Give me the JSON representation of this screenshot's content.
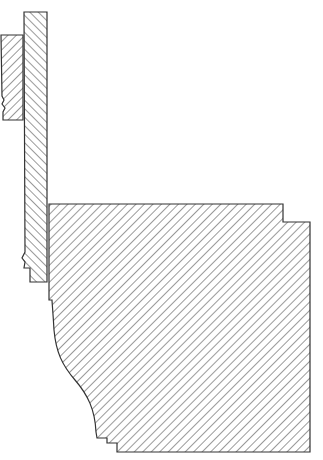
{
  "diagram": {
    "type": "architectural-section",
    "colors": {
      "stroke": "#333333",
      "hatch": "#555555",
      "background": "#ffffff"
    },
    "parts": [
      {
        "name": "left-block",
        "label": "Left block (broken edge)"
      },
      {
        "name": "vertical-strip",
        "label": "Tall vertical strip"
      },
      {
        "name": "main-molding",
        "label": "Main molding profile with ogee curve"
      }
    ]
  }
}
